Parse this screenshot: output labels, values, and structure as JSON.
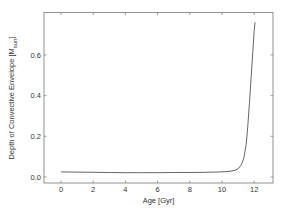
{
  "chart_data": {
    "type": "line",
    "title": "",
    "xlabel": "Age [Gyr]",
    "ylabel": "Depth of Convective Envelope [M",
    "ylabel_subscript": "sun",
    "ylabel_suffix": "]",
    "xlim": [
      -1.2,
      13.0
    ],
    "ylim": [
      -0.03,
      0.8
    ],
    "grid": false,
    "legend": null,
    "x_ticks": [
      0,
      2,
      4,
      6,
      8,
      10,
      12
    ],
    "x_tick_labels": [
      "0",
      "2",
      "4",
      "6",
      "8",
      "10",
      "12"
    ],
    "y_ticks": [
      0.0,
      0.2,
      0.4,
      0.6
    ],
    "y_tick_labels": [
      "0.0",
      "0.2",
      "0.4",
      "0.6"
    ],
    "series": [
      {
        "name": "convective envelope depth",
        "color": "#555555",
        "x": [
          0.0,
          1.0,
          2.0,
          3.0,
          4.0,
          5.0,
          6.0,
          7.0,
          8.0,
          9.0,
          10.0,
          10.5,
          10.8,
          11.0,
          11.2,
          11.35,
          11.5,
          11.6,
          11.7,
          11.8,
          11.9,
          12.0,
          12.05
        ],
        "y": [
          0.025,
          0.024,
          0.023,
          0.022,
          0.021,
          0.021,
          0.021,
          0.022,
          0.022,
          0.023,
          0.025,
          0.028,
          0.033,
          0.04,
          0.06,
          0.09,
          0.16,
          0.25,
          0.36,
          0.48,
          0.6,
          0.72,
          0.76
        ]
      }
    ]
  }
}
